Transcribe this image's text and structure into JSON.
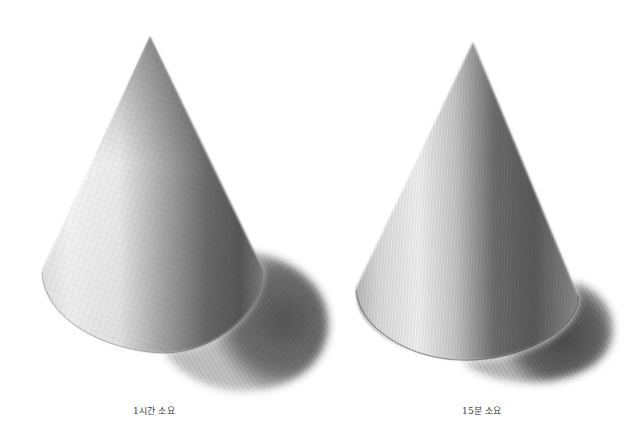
{
  "figures": [
    {
      "id": "left",
      "subject": "pencil-sketch-cone",
      "caption": "1시간 소요",
      "hatching_style": "cross-hatch, smooth tonal blend"
    },
    {
      "id": "right",
      "subject": "pencil-sketch-cone",
      "caption": "15분 소요",
      "hatching_style": "vertical strokes, coarser texture"
    }
  ],
  "colors": {
    "background": "#ffffff",
    "highlight": "#f4f4f4",
    "midtone": "#9a9a9a",
    "core_shadow": "#4a4a4a",
    "cast_shadow": "#5e5e5e",
    "caption_text": "#3a3a3a"
  }
}
